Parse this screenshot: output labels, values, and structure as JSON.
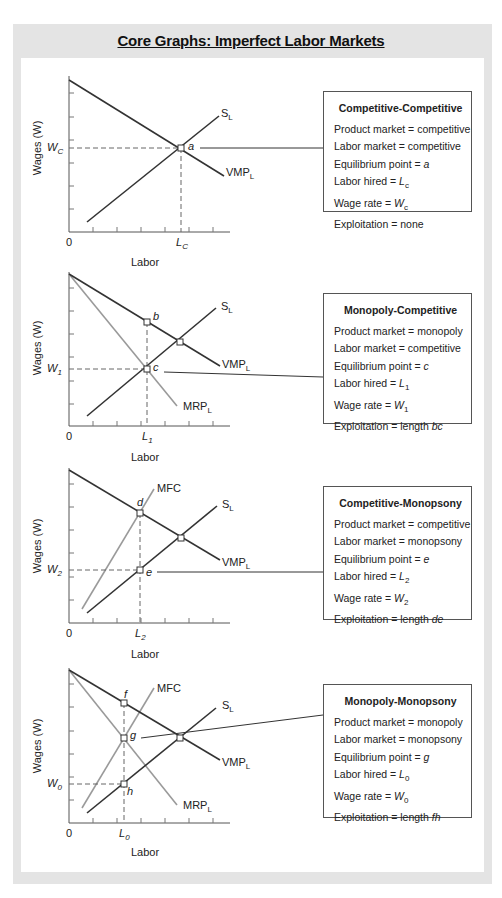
{
  "title": "Core Graphs: Imperfect Labor Markets",
  "colors": {
    "frame": "#e4e4e4",
    "dark_curve": "#333333",
    "light_curve": "#9a9a9a",
    "box_border": "#555555"
  },
  "graphs": [
    {
      "ylabel": "Wages (W)",
      "xlabel": "Labor",
      "origin": "0",
      "wage_label": "W",
      "wage_sub": "C",
      "labor_label": "L",
      "labor_sub": "C",
      "curves": {
        "supply": "S",
        "supply_sub": "L",
        "vmp": "VMP",
        "vmp_sub": "L"
      },
      "points": {
        "equilibrium": "a"
      },
      "box": {
        "title": "Competitive-Competitive",
        "lines": [
          {
            "label": "Product market = ",
            "value": "competitive"
          },
          {
            "label": "Labor market = ",
            "value": "competitive"
          },
          {
            "label": "Equilibrium point = ",
            "value": "a"
          },
          {
            "label": "Labor hired = ",
            "value": "L",
            "sub": "c"
          },
          {
            "label": "Wage rate = ",
            "value": "W",
            "sub": "c"
          },
          {
            "label": "Exploitation = ",
            "value": "none"
          }
        ]
      }
    },
    {
      "ylabel": "Wages (W)",
      "xlabel": "Labor",
      "origin": "0",
      "wage_label": "W",
      "wage_sub": "1",
      "labor_label": "L",
      "labor_sub": "1",
      "curves": {
        "supply": "S",
        "supply_sub": "L",
        "vmp": "VMP",
        "vmp_sub": "L",
        "mrp": "MRP",
        "mrp_sub": "L"
      },
      "points": {
        "top": "b",
        "equilibrium": "c"
      },
      "box": {
        "title": "Monopoly-Competitive",
        "lines": [
          {
            "label": "Product market = ",
            "value": "monopoly"
          },
          {
            "label": "Labor market = ",
            "value": "competitive"
          },
          {
            "label": "Equilibrium point = ",
            "value": "c"
          },
          {
            "label": "Labor hired = ",
            "value": "L",
            "sub": "1"
          },
          {
            "label": "Wage rate = ",
            "value": "W",
            "sub": "1"
          },
          {
            "label": "Exploitation = length ",
            "value": "bc"
          }
        ]
      }
    },
    {
      "ylabel": "Wages (W)",
      "xlabel": "Labor",
      "origin": "0",
      "wage_label": "W",
      "wage_sub": "2",
      "labor_label": "L",
      "labor_sub": "2",
      "curves": {
        "supply": "S",
        "supply_sub": "L",
        "vmp": "VMP",
        "vmp_sub": "L",
        "mfc": "MFC"
      },
      "points": {
        "top": "d",
        "equilibrium": "e"
      },
      "box": {
        "title": "Competitive-Monopsony",
        "lines": [
          {
            "label": "Product market = ",
            "value": "competitive"
          },
          {
            "label": "Labor market = ",
            "value": "monopsony"
          },
          {
            "label": "Equilibrium point = ",
            "value": "e"
          },
          {
            "label": "Labor hired = ",
            "value": "L",
            "sub": "2"
          },
          {
            "label": "Wage rate = ",
            "value": "W",
            "sub": "2"
          },
          {
            "label": "Exploitation = length ",
            "value": "de"
          }
        ]
      }
    },
    {
      "ylabel": "Wages (W)",
      "xlabel": "Labor",
      "origin": "0",
      "wage_label": "W",
      "wage_sub": "0",
      "labor_label": "L",
      "labor_sub": "0",
      "curves": {
        "supply": "S",
        "supply_sub": "L",
        "vmp": "VMP",
        "vmp_sub": "L",
        "mrp": "MRP",
        "mrp_sub": "L",
        "mfc": "MFC"
      },
      "points": {
        "top": "f",
        "equilibrium": "g",
        "bottom": "h"
      },
      "box": {
        "title": "Monopoly-Monopsony",
        "lines": [
          {
            "label": "Product market = ",
            "value": "monopoly"
          },
          {
            "label": "Labor market = ",
            "value": "monopsony"
          },
          {
            "label": "Equilibrium point = ",
            "value": "g"
          },
          {
            "label": "Labor hired = ",
            "value": "L",
            "sub": "0"
          },
          {
            "label": "Wage rate = ",
            "value": "W",
            "sub": "0"
          },
          {
            "label": "Exploitation = length ",
            "value": "fh"
          }
        ]
      }
    }
  ]
}
